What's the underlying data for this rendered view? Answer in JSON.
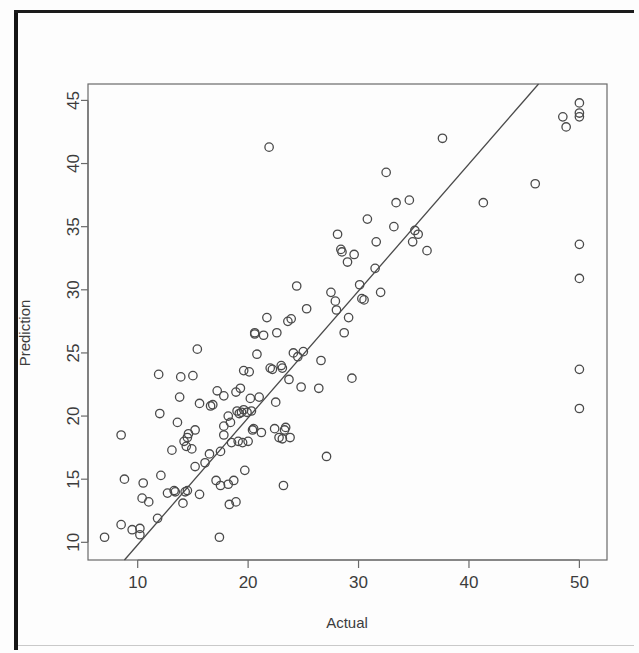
{
  "figure": {
    "kind": "scatter-plot",
    "background_color": "#fdfdfd",
    "ink_color": "#4a4a4a",
    "border_color": "#151515"
  },
  "chart_data": {
    "type": "scatter",
    "title": "",
    "subtitle": "",
    "xlabel": "Actual",
    "ylabel": "Prediction",
    "xlim": [
      5.5,
      52.5
    ],
    "ylim": [
      8.6,
      46.3
    ],
    "xticks": [
      10,
      20,
      30,
      40,
      50
    ],
    "yticks": [
      10,
      15,
      20,
      25,
      30,
      35,
      40,
      45
    ],
    "xticklabels": [
      "10",
      "20",
      "30",
      "40",
      "50"
    ],
    "yticklabels": [
      "10",
      "15",
      "20",
      "25",
      "30",
      "35",
      "40",
      "45"
    ],
    "grid": false,
    "legend": null,
    "legend_position": "none",
    "marker": {
      "shape": "open-circle",
      "radius_px": 4.2,
      "stroke": "#4a4a4a",
      "fill": "none",
      "stroke_width": 1.3
    },
    "annotations": [],
    "series": [
      {
        "name": "points",
        "marker": "open-circle",
        "points": [
          [
            7.0,
            10.4
          ],
          [
            8.5,
            11.4
          ],
          [
            8.5,
            18.5
          ],
          [
            8.8,
            15.0
          ],
          [
            9.5,
            11.0
          ],
          [
            10.2,
            10.6
          ],
          [
            10.2,
            11.1
          ],
          [
            10.4,
            13.5
          ],
          [
            10.5,
            14.7
          ],
          [
            11.0,
            13.2
          ],
          [
            11.8,
            11.9
          ],
          [
            11.9,
            23.3
          ],
          [
            12.0,
            20.2
          ],
          [
            12.1,
            15.3
          ],
          [
            12.7,
            13.9
          ],
          [
            13.1,
            17.3
          ],
          [
            13.3,
            14.1
          ],
          [
            13.4,
            14.0
          ],
          [
            13.6,
            19.5
          ],
          [
            13.8,
            21.5
          ],
          [
            13.9,
            23.1
          ],
          [
            14.1,
            13.1
          ],
          [
            14.2,
            18.0
          ],
          [
            14.3,
            14.0
          ],
          [
            14.4,
            17.6
          ],
          [
            14.5,
            18.3
          ],
          [
            14.5,
            14.1
          ],
          [
            14.6,
            18.6
          ],
          [
            14.9,
            17.4
          ],
          [
            15.0,
            23.2
          ],
          [
            15.2,
            16.0
          ],
          [
            15.2,
            18.9
          ],
          [
            15.4,
            25.3
          ],
          [
            15.6,
            13.8
          ],
          [
            15.6,
            21.0
          ],
          [
            16.1,
            16.3
          ],
          [
            16.5,
            17.0
          ],
          [
            16.6,
            20.8
          ],
          [
            16.8,
            20.9
          ],
          [
            17.1,
            14.9
          ],
          [
            17.2,
            22.0
          ],
          [
            17.4,
            10.4
          ],
          [
            17.5,
            14.5
          ],
          [
            17.5,
            17.2
          ],
          [
            17.8,
            18.5
          ],
          [
            17.8,
            21.6
          ],
          [
            17.8,
            19.2
          ],
          [
            18.2,
            14.6
          ],
          [
            18.2,
            20.0
          ],
          [
            18.3,
            13.0
          ],
          [
            18.4,
            19.5
          ],
          [
            18.5,
            17.9
          ],
          [
            18.7,
            14.9
          ],
          [
            18.9,
            13.2
          ],
          [
            18.9,
            21.9
          ],
          [
            19.0,
            20.4
          ],
          [
            19.1,
            18.0
          ],
          [
            19.2,
            20.2
          ],
          [
            19.3,
            22.2
          ],
          [
            19.4,
            20.3
          ],
          [
            19.5,
            17.9
          ],
          [
            19.6,
            23.6
          ],
          [
            19.6,
            20.5
          ],
          [
            19.7,
            15.7
          ],
          [
            19.9,
            20.3
          ],
          [
            20.0,
            18.0
          ],
          [
            20.1,
            23.5
          ],
          [
            20.2,
            21.4
          ],
          [
            20.3,
            20.4
          ],
          [
            20.4,
            18.9
          ],
          [
            20.5,
            19.0
          ],
          [
            20.6,
            26.6
          ],
          [
            20.6,
            26.5
          ],
          [
            20.8,
            24.9
          ],
          [
            21.0,
            21.5
          ],
          [
            21.2,
            18.7
          ],
          [
            21.4,
            26.4
          ],
          [
            21.7,
            27.8
          ],
          [
            21.9,
            41.3
          ],
          [
            22.0,
            23.8
          ],
          [
            22.2,
            23.7
          ],
          [
            22.4,
            19.0
          ],
          [
            22.5,
            21.1
          ],
          [
            22.6,
            26.6
          ],
          [
            22.8,
            18.3
          ],
          [
            23.0,
            24.0
          ],
          [
            23.1,
            18.2
          ],
          [
            23.1,
            23.8
          ],
          [
            23.2,
            14.5
          ],
          [
            23.3,
            18.9
          ],
          [
            23.4,
            19.1
          ],
          [
            23.6,
            27.5
          ],
          [
            23.7,
            22.9
          ],
          [
            23.8,
            18.3
          ],
          [
            23.9,
            27.7
          ],
          [
            24.1,
            25.0
          ],
          [
            24.4,
            30.3
          ],
          [
            24.5,
            24.7
          ],
          [
            24.8,
            22.3
          ],
          [
            25.0,
            25.1
          ],
          [
            25.3,
            28.5
          ],
          [
            26.4,
            22.2
          ],
          [
            26.6,
            24.4
          ],
          [
            27.1,
            16.8
          ],
          [
            27.5,
            29.8
          ],
          [
            27.9,
            29.1
          ],
          [
            28.0,
            28.4
          ],
          [
            28.1,
            34.4
          ],
          [
            28.4,
            33.2
          ],
          [
            28.5,
            33.0
          ],
          [
            28.7,
            26.6
          ],
          [
            29.0,
            32.2
          ],
          [
            29.1,
            27.8
          ],
          [
            29.4,
            23.0
          ],
          [
            29.6,
            32.8
          ],
          [
            30.1,
            30.4
          ],
          [
            30.3,
            29.3
          ],
          [
            30.5,
            29.2
          ],
          [
            30.8,
            35.6
          ],
          [
            31.5,
            31.7
          ],
          [
            31.6,
            33.8
          ],
          [
            32.0,
            29.8
          ],
          [
            32.5,
            39.3
          ],
          [
            33.2,
            35.0
          ],
          [
            33.4,
            36.9
          ],
          [
            34.6,
            37.1
          ],
          [
            34.9,
            33.8
          ],
          [
            35.1,
            34.7
          ],
          [
            35.4,
            34.4
          ],
          [
            36.2,
            33.1
          ],
          [
            37.6,
            42.0
          ],
          [
            41.3,
            36.9
          ],
          [
            46.0,
            38.4
          ],
          [
            48.5,
            43.7
          ],
          [
            48.8,
            42.9
          ],
          [
            50.0,
            44.8
          ],
          [
            50.0,
            44.0
          ],
          [
            50.0,
            43.7
          ],
          [
            50.0,
            33.6
          ],
          [
            50.0,
            30.9
          ],
          [
            50.0,
            23.7
          ],
          [
            50.0,
            20.6
          ]
        ]
      }
    ],
    "reference_line": {
      "name": "identity-line",
      "kind": "straight-line",
      "description": "y = x diagonal reference line",
      "from": [
        8.8,
        8.6
      ],
      "to": [
        46.3,
        46.3
      ],
      "stroke": "#4a4a4a",
      "stroke_width": 1.3
    }
  }
}
